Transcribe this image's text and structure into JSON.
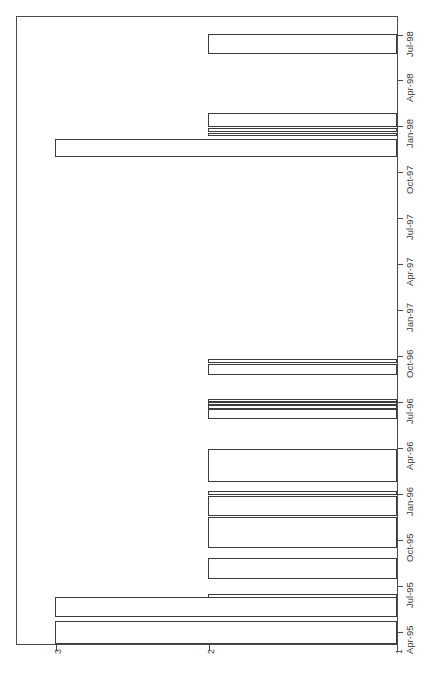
{
  "chart_data": {
    "type": "bar",
    "orientation": "horizontal-rotated",
    "title": "",
    "subtitle": "",
    "xlabel": "",
    "ylabel": "",
    "value_axis": {
      "ticks": [
        1,
        2,
        3
      ],
      "tick_labels": [
        "1",
        "2",
        "3"
      ],
      "range": [
        1,
        3
      ],
      "grid": false
    },
    "time_axis": {
      "tick_labels": [
        "Apr-95",
        "Jul-95",
        "Oct-95",
        "Jan-96",
        "Apr-96",
        "Jul-96",
        "Oct-96",
        "Jan-97",
        "Apr-97",
        "Jul-97",
        "Oct-97",
        "Jan-98",
        "Apr-98",
        "Jul-98"
      ],
      "range": [
        "Apr-95",
        "Jul-98"
      ],
      "grid": false
    },
    "legend": {
      "entries": [],
      "position": "none"
    },
    "categories": [
      "Apr-95",
      "May-95",
      "Jun-95",
      "Jul-95",
      "Aug-95",
      "Sep-95",
      "Oct-95",
      "Nov-95",
      "Dec-95",
      "Jan-96",
      "Feb-96",
      "Mar-96",
      "Apr-96",
      "May-96",
      "Jun-96",
      "Jul-96",
      "Aug-96",
      "Sep-96",
      "Oct-96",
      "Nov-96",
      "Dec-96",
      "Jan-97",
      "Apr-97",
      "Jul-97",
      "Oct-97",
      "Nov-97",
      "Dec-97",
      "Jan-98",
      "Apr-98",
      "Jul-98"
    ],
    "values": [
      3,
      3,
      1,
      1,
      2,
      2,
      2,
      2,
      2,
      2,
      2,
      2,
      2,
      2,
      2,
      2,
      2,
      2,
      2,
      2,
      1,
      1,
      1,
      1,
      3,
      2,
      2,
      2,
      1,
      2
    ],
    "bars": [
      {
        "label": "Jul-98",
        "value": 2,
        "top": 33,
        "height": 20
      },
      {
        "label": "Jan-98-a",
        "value": 2,
        "top": 112,
        "height": 14
      },
      {
        "label": "Jan-98-b",
        "value": 2,
        "top": 127,
        "height": 4
      },
      {
        "label": "Jan-98-c",
        "value": 2,
        "top": 132,
        "height": 3
      },
      {
        "label": "Oct-97",
        "value": 3,
        "top": 138,
        "height": 18
      },
      {
        "label": "Oct-96-a",
        "value": 2,
        "top": 358,
        "height": 4
      },
      {
        "label": "Oct-96-b",
        "value": 2,
        "top": 363,
        "height": 11
      },
      {
        "label": "Jul-96-a",
        "value": 2,
        "top": 398,
        "height": 3
      },
      {
        "label": "Jul-96-b",
        "value": 2,
        "top": 401,
        "height": 3
      },
      {
        "label": "Jul-96-c",
        "value": 2,
        "top": 404,
        "height": 4
      },
      {
        "label": "Jul-96-d",
        "value": 2,
        "top": 408,
        "height": 10
      },
      {
        "label": "Apr-96",
        "value": 2,
        "top": 448,
        "height": 33
      },
      {
        "label": "Jan-96-a",
        "value": 2,
        "top": 490,
        "height": 4
      },
      {
        "label": "Jan-96-b",
        "value": 2,
        "top": 495,
        "height": 20
      },
      {
        "label": "Jan-96-c",
        "value": 2,
        "top": 516,
        "height": 31
      },
      {
        "label": "Oct-95",
        "value": 2,
        "top": 557,
        "height": 21
      },
      {
        "label": "Jul-95",
        "value": 2,
        "top": 593,
        "height": 22
      },
      {
        "label": "Apr-95-a",
        "value": 3,
        "top": 596,
        "height": 20
      },
      {
        "label": "Apr-95-b",
        "value": 3,
        "top": 620,
        "height": 23
      }
    ]
  },
  "axis": {
    "value_ticks": [
      {
        "label": "3",
        "pos": 56
      },
      {
        "label": "2",
        "pos": 209
      },
      {
        "label": "1",
        "pos": 397
      }
    ],
    "time_ticks": [
      {
        "label": "Jul-98",
        "pos": 35
      },
      {
        "label": "Apr-98",
        "pos": 80
      },
      {
        "label": "Jan-98",
        "pos": 126
      },
      {
        "label": "Oct-97",
        "pos": 172
      },
      {
        "label": "Jul-97",
        "pos": 218
      },
      {
        "label": "Apr-97",
        "pos": 264
      },
      {
        "label": "Jan-97",
        "pos": 310
      },
      {
        "label": "Oct-96",
        "pos": 356
      },
      {
        "label": "Jul-96",
        "pos": 402
      },
      {
        "label": "Apr-96",
        "pos": 448
      },
      {
        "label": "Jan-96",
        "pos": 494
      },
      {
        "label": "Oct-95",
        "pos": 540
      },
      {
        "label": "Jul-95",
        "pos": 586
      },
      {
        "label": "Apr-95",
        "pos": 632
      }
    ]
  },
  "colors": {
    "frame": "#4a4a4a",
    "bar_stroke": "#3c3c3c",
    "bar_fill": "#ffffff",
    "text": "#3a3a3a",
    "background": "#ffffff"
  }
}
